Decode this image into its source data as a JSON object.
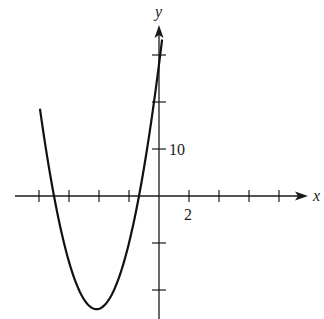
{
  "chart_data": {
    "type": "line",
    "title": "",
    "xlabel": "x",
    "ylabel": "y",
    "function": "y = 3x^2 + 25x + 28",
    "x_tick_step": 2,
    "y_tick_step": 10,
    "labeled_ticks": {
      "x": [
        "2"
      ],
      "y": [
        "10"
      ]
    },
    "x_ticks": [
      -8,
      -6,
      -4,
      -2,
      2,
      4,
      6,
      8
    ],
    "y_ticks": [
      -20,
      -10,
      10,
      20,
      30
    ],
    "xlim": [
      -9.6,
      9.7
    ],
    "ylim": [
      -26,
      36
    ],
    "grid": false,
    "legend": "none",
    "series": [
      {
        "name": "parabola",
        "x": [
          -7.93,
          -7,
          -6,
          -5,
          -4.17,
          -3,
          -2,
          -1.33,
          -1,
          0,
          0.2
        ],
        "values": [
          20,
          0,
          -14,
          -22,
          -24.1,
          -20,
          -10,
          0,
          6,
          28,
          33.1
        ]
      }
    ],
    "features": {
      "x_intercepts": [
        -7,
        -1.33
      ],
      "y_intercept": 28,
      "vertex": [
        -4.17,
        -24.08
      ]
    },
    "colors": {
      "axis": "#1a1a1a",
      "curve": "#111111",
      "background": "#ffffff"
    }
  }
}
